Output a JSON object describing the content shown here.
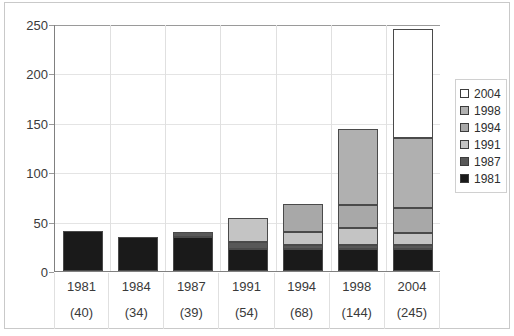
{
  "chart_data": {
    "type": "bar",
    "stacked": true,
    "title": "",
    "xlabel": "",
    "ylabel": "",
    "categories": [
      "1981",
      "1984",
      "1987",
      "1991",
      "1994",
      "1998",
      "2004"
    ],
    "category_totals": [
      "(40)",
      "(34)",
      "(39)",
      "(54)",
      "(68)",
      "(144)",
      "(245)"
    ],
    "totals": [
      40,
      34,
      39,
      54,
      68,
      144,
      245
    ],
    "ylim": [
      0,
      250
    ],
    "yticks": [
      0,
      50,
      100,
      150,
      200,
      250
    ],
    "ytick_labels": [
      "0",
      "50",
      "100",
      "150",
      "200",
      "250"
    ],
    "grid": true,
    "legend_position": "right",
    "series": [
      {
        "name": "1981",
        "color": "#1a1a1a",
        "values": [
          40,
          34,
          34,
          22,
          22,
          22,
          22
        ]
      },
      {
        "name": "1987",
        "color": "#585858",
        "values": [
          0,
          0,
          5,
          7,
          4,
          4,
          4
        ]
      },
      {
        "name": "1991",
        "color": "#c4c4c4",
        "values": [
          0,
          0,
          0,
          25,
          13,
          18,
          12
        ]
      },
      {
        "name": "1994",
        "color": "#a8a8a8",
        "values": [
          0,
          0,
          0,
          0,
          29,
          23,
          26
        ]
      },
      {
        "name": "1998",
        "color": "#b0b0b0",
        "values": [
          0,
          0,
          0,
          0,
          0,
          77,
          71
        ]
      },
      {
        "name": "2004",
        "color": "#ffffff",
        "values": [
          0,
          0,
          0,
          0,
          0,
          0,
          110
        ]
      }
    ],
    "legend_entries": [
      {
        "label": "2004",
        "color": "#ffffff"
      },
      {
        "label": "1998",
        "color": "#b0b0b0"
      },
      {
        "label": "1994",
        "color": "#a8a8a8"
      },
      {
        "label": "1991",
        "color": "#c4c4c4"
      },
      {
        "label": "1987",
        "color": "#585858"
      },
      {
        "label": "1981",
        "color": "#1a1a1a"
      }
    ]
  }
}
